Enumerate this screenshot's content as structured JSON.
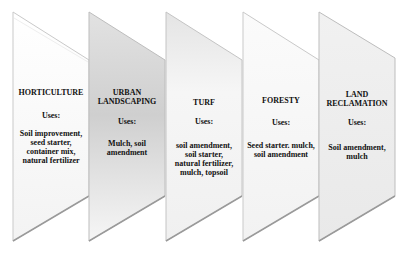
{
  "diagram": {
    "panels": [
      {
        "title": "HORTICULTURE",
        "uses_label": "Uses:",
        "uses": [
          "Soil improvement,",
          "seed starter,",
          "container mix,",
          "natural fertilizer"
        ],
        "fill": "#fbfbfb",
        "shade": "#f2f2f2"
      },
      {
        "title": "URBAN LANDSCAPING",
        "title_lines": [
          "URBAN",
          "LANDSCAPING"
        ],
        "uses_label": "Uses:",
        "uses": [
          "Mulch, soil",
          "amendment"
        ],
        "fill": "#d6d6d6",
        "shade": "#f3f3f3"
      },
      {
        "title": "TURF",
        "uses_label": "Uses:",
        "uses": [
          "soil amendment,",
          "soil starter,",
          "natural fertilizer,",
          "mulch, topsoil"
        ],
        "fill": "#f4f4f4",
        "shade": "#dedede"
      },
      {
        "title": "FORESTY",
        "uses_label": "Uses:",
        "uses": [
          "Seed starter. mulch,",
          "soil amendment"
        ],
        "fill": "#fafafa",
        "shade": "#f1f1f1"
      },
      {
        "title": "LAND RECLAMATION",
        "title_lines": [
          "LAND",
          "RECLAMATION"
        ],
        "uses_label": "Uses:",
        "uses": [
          "Soil amendment,",
          "mulch"
        ],
        "fill": "#efefef",
        "shade": "#e6e6e6"
      }
    ]
  }
}
